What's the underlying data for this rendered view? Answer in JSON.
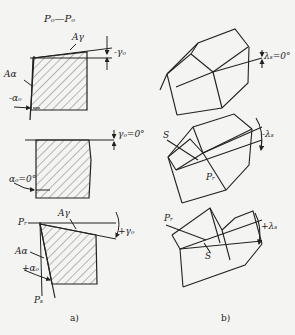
{
  "figure": {
    "section_label": "Pₒ—Pₒ",
    "panel_a": {
      "caption": "a)",
      "top": {
        "rake_face": "Aγ",
        "rake_angle": "-γₒ",
        "flank_face": "Aα",
        "clearance_angle": "-αₒ"
      },
      "middle": {
        "rake_angle": "γₒ=0°",
        "clearance_angle": "αₒ=0°"
      },
      "bottom": {
        "ref_plane": "Pᵣ",
        "rake_face": "Aγ",
        "rake_angle": "+γₒ",
        "flank_face": "Aα",
        "clearance_angle": "+αₒ",
        "cutting_plane": "Pₛ"
      }
    },
    "panel_b": {
      "caption": "b)",
      "top": {
        "inclination": "λₛ=0°"
      },
      "middle": {
        "edge": "S",
        "ref_plane": "Pᵣ",
        "inclination": "-λₛ"
      },
      "bottom": {
        "ref_plane": "Pᵣ",
        "edge": "S",
        "inclination": "+λₛ"
      }
    }
  },
  "colors": {
    "background": "#f4f4f2",
    "ink": "#222222",
    "hatch": "#555555"
  }
}
